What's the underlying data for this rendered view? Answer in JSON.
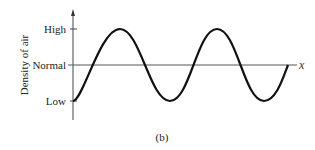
{
  "diagram": {
    "y_axis_label": "Density of air",
    "x_axis_label": "x",
    "caption": "(b)",
    "levels": [
      {
        "label": "High",
        "y": 29
      },
      {
        "label": "Normal",
        "y": 65
      },
      {
        "label": "Low",
        "y": 101
      }
    ],
    "curve": "sinusoidal density wave starting at Low, two full periods"
  }
}
